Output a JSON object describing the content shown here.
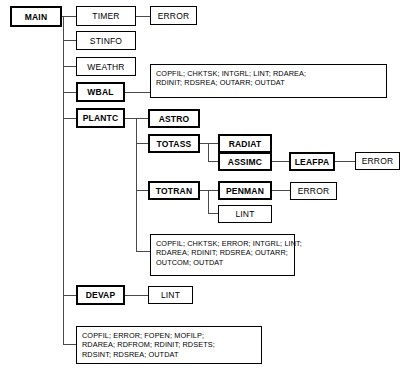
{
  "diagram": {
    "nodes": [
      {
        "id": "main",
        "label": "MAIN",
        "style": "bold"
      },
      {
        "id": "timer",
        "label": "TIMER",
        "style": "thin"
      },
      {
        "id": "error1",
        "label": "ERROR",
        "style": "thin"
      },
      {
        "id": "stinfo",
        "label": "STINFO",
        "style": "thin"
      },
      {
        "id": "weathr",
        "label": "WEATHR",
        "style": "thin"
      },
      {
        "id": "wbal",
        "label": "WBAL",
        "style": "bold"
      },
      {
        "id": "plantc",
        "label": "PLANTC",
        "style": "bold"
      },
      {
        "id": "astro",
        "label": "ASTRO",
        "style": "bold"
      },
      {
        "id": "totass",
        "label": "TOTASS",
        "style": "bold"
      },
      {
        "id": "radiat",
        "label": "RADIAT",
        "style": "bold"
      },
      {
        "id": "assimc",
        "label": "ASSIMC",
        "style": "bold"
      },
      {
        "id": "leafpa",
        "label": "LEAFPA",
        "style": "bold"
      },
      {
        "id": "error2",
        "label": "ERROR",
        "style": "thin"
      },
      {
        "id": "totran",
        "label": "TOTRAN",
        "style": "bold"
      },
      {
        "id": "penman",
        "label": "PENMAN",
        "style": "bold"
      },
      {
        "id": "error3",
        "label": "ERROR",
        "style": "thin"
      },
      {
        "id": "lint1",
        "label": "LINT",
        "style": "thin"
      },
      {
        "id": "devap",
        "label": "DEVAP",
        "style": "bold"
      },
      {
        "id": "lint2",
        "label": "LINT",
        "style": "thin"
      }
    ],
    "utility_lists": [
      {
        "id": "wbal-utilities",
        "lines": [
          "COPFIL; CHKTSK; INTGRL; LINT; RDAREA;",
          "RDINIT; RDSREA; OUTARR; OUTDAT"
        ]
      },
      {
        "id": "plantc-utilities",
        "lines": [
          "COPFIL; CHKTSK; ERROR; INTGRL; LINT;",
          "RDAREA; RDINIT; RDSREA; OUTARR;",
          "OUTCOM; OUTDAT"
        ]
      },
      {
        "id": "main-utilities",
        "lines": [
          "COPFIL; ERROR; FOPEN; MOFILP;",
          "RDAREA; RDFROM; RDINIT; RDSETS;",
          "RDSINT; RDSREA; OUTDAT"
        ]
      }
    ],
    "colors": {
      "background": "#ffffff",
      "box_border": "#000000",
      "text": "#000000",
      "connector": "#4a4a4a"
    }
  }
}
